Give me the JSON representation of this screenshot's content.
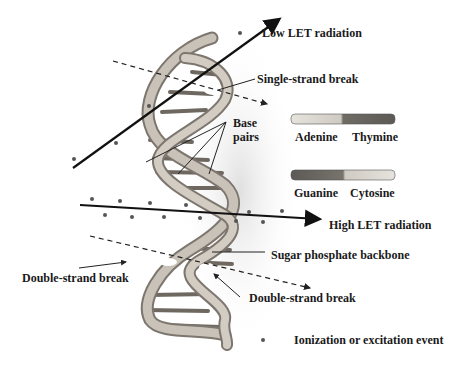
{
  "labels": {
    "low_let": "Low LET radiation",
    "single_strand_break": "Single-strand break",
    "base_pairs_line1": "Base",
    "base_pairs_line2": "pairs",
    "adenine": "Adenine",
    "thymine": "Thymine",
    "guanine": "Guanine",
    "cytosine": "Cytosine",
    "high_let": "High LET radiation",
    "sugar_phosphate_backbone": "Sugar phosphate backbone",
    "double_strand_break_left": "Double-strand break",
    "double_strand_break_right": "Double-strand break",
    "legend_ionization": "Ionization or excitation event"
  },
  "colors": {
    "strand": "#b8b0a6",
    "strand_edge": "#7d766e",
    "adenine": "#d4d0c8",
    "thymine": "#6a6660",
    "guanine": "#6a6660",
    "cytosine": "#cfcbc3",
    "ink": "#1a1a1a",
    "dot": "#555555"
  }
}
